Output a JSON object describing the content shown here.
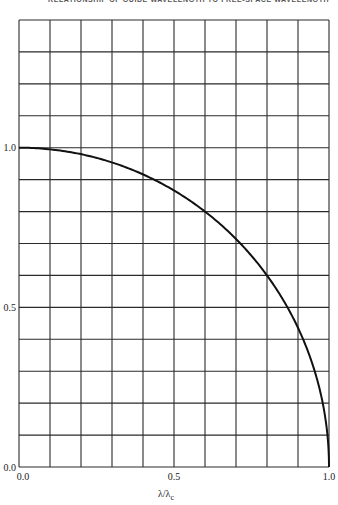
{
  "header": {
    "title": "RELATIONSHIP OF GUIDE WAVELENGTH TO FREE-SPACE WAVELENGTH"
  },
  "chart_data": {
    "type": "line",
    "title": "RELATIONSHIP OF GUIDE WAVELENGTH TO FREE-SPACE WAVELENGTH",
    "xlabel": "λ/λc",
    "ylabel": "",
    "xlim": [
      0.0,
      1.0
    ],
    "ylim": [
      0.0,
      1.4
    ],
    "grid": true,
    "grid_step_x": 0.1,
    "grid_step_y": 0.1,
    "x_tick_labels": [
      "0.0",
      "0.5",
      "1.0"
    ],
    "y_tick_labels": [
      "0.0",
      "0.5",
      "1.0"
    ],
    "legend": null,
    "series": [
      {
        "name": "sqrt(1 - (λ/λc)^2)",
        "x": [
          0.0,
          0.1,
          0.2,
          0.3,
          0.4,
          0.5,
          0.6,
          0.7,
          0.8,
          0.9,
          0.95,
          0.98,
          1.0
        ],
        "values": [
          1.0,
          0.995,
          0.98,
          0.954,
          0.917,
          0.866,
          0.8,
          0.714,
          0.6,
          0.436,
          0.312,
          0.199,
          0.0
        ]
      }
    ]
  },
  "axes": {
    "y_ticks": [
      {
        "value": 0.0,
        "label": "0.0"
      },
      {
        "value": 0.5,
        "label": "0.5"
      },
      {
        "value": 1.0,
        "label": "1.0"
      }
    ],
    "x_ticks": [
      {
        "value": 0.0,
        "label": "0.0"
      },
      {
        "value": 0.5,
        "label": "0.5"
      },
      {
        "value": 1.0,
        "label": "1.0"
      }
    ],
    "x_label_main": "λ/λ",
    "x_label_sub": "c"
  },
  "colors": {
    "grid": "#2a2a2a",
    "curve": "#111111",
    "text": "#222222"
  }
}
